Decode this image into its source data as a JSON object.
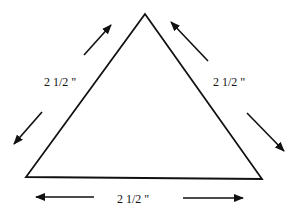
{
  "diagram": {
    "shape": "equilateral-triangle",
    "stroke_color": "#111111",
    "background": "#ffffff",
    "sides": [
      {
        "name": "left",
        "label": "2 1/2 \""
      },
      {
        "name": "right",
        "label": "2 1/2 \""
      },
      {
        "name": "bottom",
        "label": "2 1/2 \""
      }
    ]
  }
}
